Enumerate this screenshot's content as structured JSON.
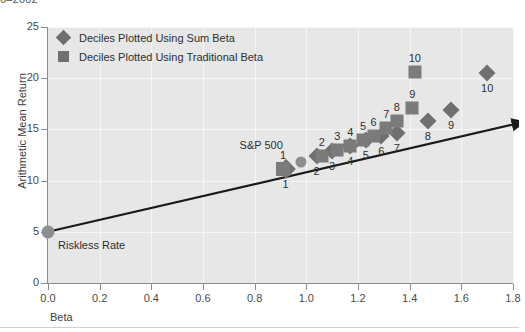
{
  "figure": {
    "clipped_title": "6–2002",
    "background_color": "#ffffff",
    "plot_background_color": "#e7e7e7",
    "gridline_color": "#f7f7f7",
    "marker_color": "#6f6f6f",
    "square_color": "#7b7b7b",
    "circle_color": "#8e8e8e",
    "trendline_color": "#1a1a1a"
  },
  "legend": {
    "position": "top-left-inside",
    "entries": [
      {
        "marker": "diamond",
        "label": "Deciles Plotted Using Sum Beta"
      },
      {
        "marker": "square",
        "label": "Deciles Plotted Using Traditional Beta"
      }
    ]
  },
  "annotations": {
    "riskless_rate": "Riskless Rate",
    "sp500": "S&P 500"
  },
  "chart_data": {
    "type": "scatter",
    "title": "6–2002",
    "xlabel": "Beta",
    "ylabel": "Arithmetic Mean Return",
    "xlim": [
      0.0,
      1.8
    ],
    "ylim": [
      0,
      25
    ],
    "xticks": [
      "0.0",
      "0.2",
      "0.4",
      "0.6",
      "0.8",
      "1.0",
      "1.2",
      "1.4",
      "1.6",
      "1.8"
    ],
    "xtick_values": [
      0.0,
      0.2,
      0.4,
      0.6,
      0.8,
      1.0,
      1.2,
      1.4,
      1.6,
      1.8
    ],
    "yticks": [
      "0",
      "5",
      "10",
      "15",
      "20",
      "25"
    ],
    "ytick_values": [
      0,
      5,
      10,
      15,
      20,
      25
    ],
    "grid": true,
    "legend_position": "upper left",
    "series": [
      {
        "name": "Deciles Plotted Using Sum Beta",
        "marker": "diamond",
        "color": "#6f6f6f",
        "labels": [
          "1",
          "2",
          "3",
          "4",
          "5",
          "6",
          "7",
          "8",
          "9",
          "10"
        ],
        "label_position": "below",
        "points": [
          {
            "label": "1",
            "x": 0.92,
            "y": 11.1
          },
          {
            "label": "2",
            "x": 1.04,
            "y": 12.4
          },
          {
            "label": "3",
            "x": 1.1,
            "y": 12.9
          },
          {
            "label": "4",
            "x": 1.17,
            "y": 13.4
          },
          {
            "label": "5",
            "x": 1.23,
            "y": 14.0
          },
          {
            "label": "6",
            "x": 1.29,
            "y": 14.4
          },
          {
            "label": "7",
            "x": 1.35,
            "y": 14.6
          },
          {
            "label": "8",
            "x": 1.47,
            "y": 15.8
          },
          {
            "label": "9",
            "x": 1.56,
            "y": 16.9
          },
          {
            "label": "10",
            "x": 1.7,
            "y": 20.5
          }
        ]
      },
      {
        "name": "Deciles Plotted Using Traditional Beta",
        "marker": "square",
        "color": "#7b7b7b",
        "labels": [
          "1",
          "2",
          "3",
          "4",
          "5",
          "6",
          "7",
          "8",
          "9",
          "10"
        ],
        "label_position": "above",
        "points": [
          {
            "label": "1",
            "x": 0.91,
            "y": 11.1
          },
          {
            "label": "2",
            "x": 1.06,
            "y": 12.4
          },
          {
            "label": "3",
            "x": 1.12,
            "y": 13.0
          },
          {
            "label": "4",
            "x": 1.17,
            "y": 13.4
          },
          {
            "label": "5",
            "x": 1.22,
            "y": 14.0
          },
          {
            "label": "6",
            "x": 1.26,
            "y": 14.4
          },
          {
            "label": "7",
            "x": 1.31,
            "y": 15.1
          },
          {
            "label": "8",
            "x": 1.35,
            "y": 15.8
          },
          {
            "label": "9",
            "x": 1.41,
            "y": 17.1
          },
          {
            "label": "10",
            "x": 1.42,
            "y": 20.6
          }
        ]
      }
    ],
    "reference_points": [
      {
        "name": "Riskless Rate",
        "marker": "circle",
        "x": 0.0,
        "y": 5.0
      },
      {
        "name": "S&P 500",
        "marker": "circle",
        "x": 0.98,
        "y": 11.8
      }
    ],
    "trendline": {
      "type": "security-market-line",
      "arrow": true,
      "x_start": 0.0,
      "y_start": 5.0,
      "x_end": 1.8,
      "y_end": 15.5
    }
  }
}
